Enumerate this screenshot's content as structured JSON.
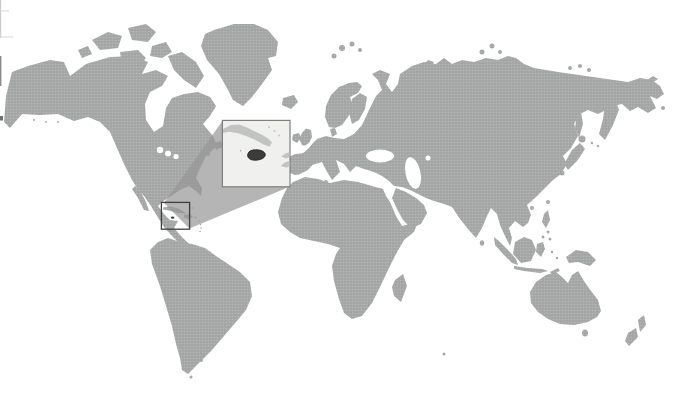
{
  "figure": {
    "type": "world-locator-map"
  },
  "colors": {
    "ocean": "#ffffff",
    "land_base": "#a4a6a5",
    "land_dot": "#b6b8b7",
    "inset_background": "#f0f0ee",
    "inset_border": "#7f7f7f",
    "inset_land": "#c2c4c3",
    "inset_land_speck": "#9a9c9b",
    "highlight": "#3b3d3c",
    "highlight_outline": "#1c1c1c",
    "locator_box_border": "#3e3e3e",
    "beam": "rgba(150,150,150,0.7)",
    "artifact_light": "#cccccc",
    "artifact_faint": "#d6d6d6",
    "artifact_mid": "#8a8a8a",
    "artifact_dark": "#6f6f6f"
  }
}
